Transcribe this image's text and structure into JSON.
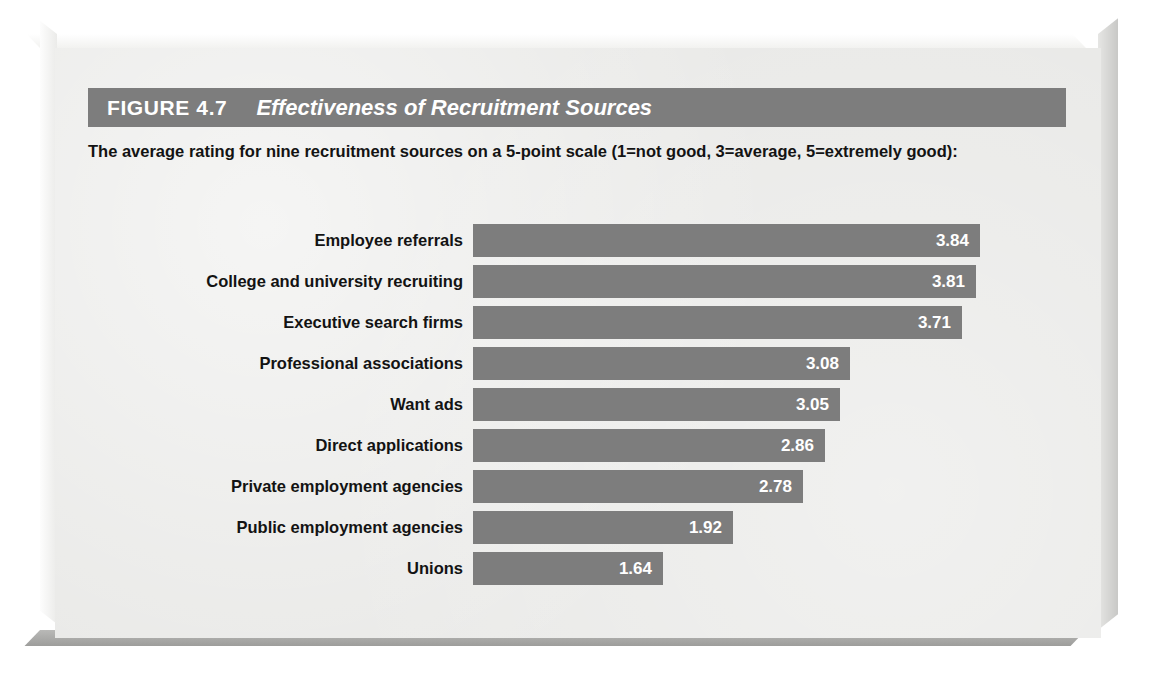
{
  "figure": {
    "number": "FIGURE 4.7",
    "title": "Effectiveness of Recruitment Sources",
    "subtitle": "The average rating for nine recruitment sources on a 5-point scale (1=not good, 3=average, 5=extremely good):"
  },
  "colors": {
    "bar": "#7d7d7d",
    "title_bar": "#7d7d7d",
    "card_background": "#e9e9e7",
    "text": "#131313",
    "value_text": "#ffffff"
  },
  "chart_data": {
    "type": "bar",
    "orientation": "horizontal",
    "title": "Effectiveness of Recruitment Sources",
    "subtitle": "The average rating for nine recruitment sources on a 5-point scale (1=not good, 3=average, 5=extremely good):",
    "xlabel": "",
    "ylabel": "",
    "xlim": [
      0,
      5
    ],
    "grid": false,
    "legend": false,
    "scale_note": "5-point scale: 1=not good, 3=average, 5=extremely good",
    "categories": [
      "Employee referrals",
      "College and university recruiting",
      "Executive search firms",
      "Professional associations",
      "Want ads",
      "Direct applications",
      "Private employment agencies",
      "Public employment agencies",
      "Unions"
    ],
    "values": [
      3.84,
      3.81,
      3.71,
      3.08,
      3.05,
      2.86,
      2.78,
      1.92,
      1.64
    ],
    "value_labels": [
      "3.84",
      "3.81",
      "3.71",
      "3.08",
      "3.05",
      "2.86",
      "2.78",
      "1.92",
      "1.64"
    ],
    "bar_px_widths": [
      507,
      503,
      489,
      377,
      367,
      352,
      330,
      260,
      190
    ]
  }
}
